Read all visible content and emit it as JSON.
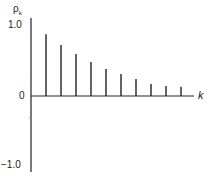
{
  "chart_data": {
    "type": "bar",
    "title": "",
    "ylabel": "ρk",
    "xlabel": "k",
    "ylim": [
      -1.0,
      1.0
    ],
    "yticks": [
      "1.0",
      "0",
      "−1.0"
    ],
    "grid": false,
    "categories": [
      1,
      2,
      3,
      4,
      5,
      6,
      7,
      8,
      9,
      10
    ],
    "values": [
      0.87,
      0.72,
      0.59,
      0.48,
      0.38,
      0.31,
      0.24,
      0.17,
      0.14,
      0.13
    ]
  },
  "labels": {
    "y_axis": "ρ",
    "y_axis_sub": "k",
    "x_axis": "k",
    "tick_top": "1.0",
    "tick_zero": "0",
    "tick_bottom": "−1.0"
  }
}
